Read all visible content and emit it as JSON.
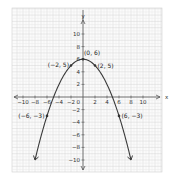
{
  "chart_data": {
    "type": "line",
    "title": "",
    "xlabel": "x",
    "ylabel": "y",
    "xlim": [
      -11,
      11
    ],
    "ylim": [
      -11,
      12
    ],
    "grid": true,
    "equation": "y = -0.25x^2 + 6",
    "x_ticks": [
      -10,
      -8,
      -6,
      -4,
      -2,
      2,
      4,
      6,
      8,
      10
    ],
    "y_ticks": [
      -10,
      -8,
      -6,
      -4,
      -2,
      2,
      4,
      6,
      8,
      10
    ],
    "origin_label": "0",
    "series": [
      {
        "name": "parabola",
        "x": [
          -8,
          -7,
          -6,
          -5,
          -4,
          -3,
          -2,
          -1,
          0,
          1,
          2,
          3,
          4,
          5,
          6,
          7,
          8
        ],
        "y": [
          -10,
          -6.25,
          -3,
          -0.25,
          2,
          3.75,
          5,
          5.75,
          6,
          5.75,
          5,
          3.75,
          2,
          -0.25,
          -3,
          -6.25,
          -10
        ]
      }
    ],
    "annotations": [
      {
        "x": 0,
        "y": 6,
        "text": "(0, 6)"
      },
      {
        "x": -2,
        "y": 5,
        "text": "(-2, 5)"
      },
      {
        "x": 2,
        "y": 5,
        "text": "(2, 5)"
      },
      {
        "x": -6,
        "y": -3,
        "text": "(-6, -3)"
      },
      {
        "x": 6,
        "y": -3,
        "text": "(6, -3)"
      }
    ]
  }
}
